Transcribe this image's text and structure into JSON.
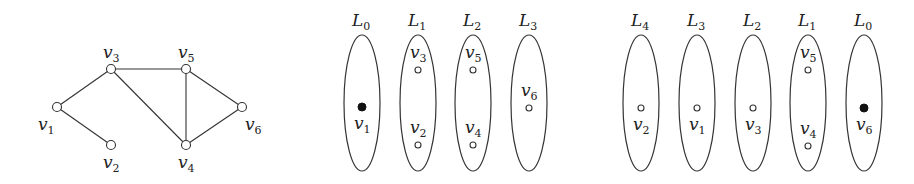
{
  "graph": {
    "nodes": [
      {
        "id": "v1",
        "base": "v",
        "sub": "1",
        "x": 57,
        "y": 107,
        "lx": 38,
        "ly": 130
      },
      {
        "id": "v2",
        "base": "v",
        "sub": "2",
        "x": 111,
        "y": 145,
        "lx": 103,
        "ly": 168
      },
      {
        "id": "v3",
        "base": "v",
        "sub": "3",
        "x": 111,
        "y": 69,
        "lx": 103,
        "ly": 58
      },
      {
        "id": "v4",
        "base": "v",
        "sub": "4",
        "x": 186,
        "y": 145,
        "lx": 178,
        "ly": 168
      },
      {
        "id": "v5",
        "base": "v",
        "sub": "5",
        "x": 186,
        "y": 69,
        "lx": 178,
        "ly": 58
      },
      {
        "id": "v6",
        "base": "v",
        "sub": "6",
        "x": 242,
        "y": 107,
        "lx": 245,
        "ly": 130
      }
    ],
    "edges": [
      [
        "v1",
        "v3"
      ],
      [
        "v1",
        "v2"
      ],
      [
        "v3",
        "v5"
      ],
      [
        "v3",
        "v4"
      ],
      [
        "v5",
        "v4"
      ],
      [
        "v5",
        "v6"
      ],
      [
        "v4",
        "v6"
      ]
    ]
  },
  "layering_left": {
    "root": "v1",
    "layers": [
      {
        "base": "L",
        "sub": "0",
        "cx": 362,
        "nodes": [
          {
            "id": "v1",
            "y": 107,
            "root": true,
            "label_below": true
          }
        ]
      },
      {
        "base": "L",
        "sub": "1",
        "cx": 418,
        "nodes": [
          {
            "id": "v3",
            "y": 70,
            "label_below": false
          },
          {
            "id": "v2",
            "y": 145,
            "label_below": false
          }
        ]
      },
      {
        "base": "L",
        "sub": "2",
        "cx": 473,
        "nodes": [
          {
            "id": "v5",
            "y": 70,
            "label_below": false
          },
          {
            "id": "v4",
            "y": 145,
            "label_below": false
          }
        ]
      },
      {
        "base": "L",
        "sub": "3",
        "cx": 529,
        "nodes": [
          {
            "id": "v6",
            "y": 108,
            "label_below": false
          }
        ]
      }
    ]
  },
  "layering_right": {
    "root": "v6",
    "layers": [
      {
        "base": "L",
        "sub": "4",
        "cx": 641,
        "nodes": [
          {
            "id": "v2",
            "y": 108,
            "label_below": true
          }
        ]
      },
      {
        "base": "L",
        "sub": "3",
        "cx": 697,
        "nodes": [
          {
            "id": "v1",
            "y": 108,
            "label_below": true
          }
        ]
      },
      {
        "base": "L",
        "sub": "2",
        "cx": 753,
        "nodes": [
          {
            "id": "v3",
            "y": 108,
            "label_below": true
          }
        ]
      },
      {
        "base": "L",
        "sub": "1",
        "cx": 808,
        "nodes": [
          {
            "id": "v5",
            "y": 70,
            "label_below": false
          },
          {
            "id": "v4",
            "y": 146,
            "label_below": false
          }
        ]
      },
      {
        "base": "L",
        "sub": "0",
        "cx": 864,
        "nodes": [
          {
            "id": "v6",
            "y": 108,
            "root": true,
            "label_below": true
          }
        ]
      }
    ]
  }
}
